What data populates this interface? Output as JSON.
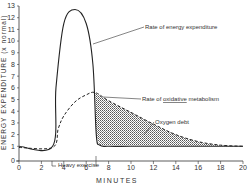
{
  "chart_data": {
    "type": "line",
    "title": "",
    "xlabel": "MINUTES",
    "ylabel": "ENERGY EXPENDITURE (x normal)",
    "xlim": [
      0,
      20
    ],
    "ylim": [
      0,
      13
    ],
    "x_ticks": [
      "0",
      "2",
      "4",
      "6",
      "8",
      "10",
      "12",
      "14",
      "16",
      "18",
      "20"
    ],
    "y_ticks": [
      "0",
      "1",
      "2",
      "3",
      "4",
      "5",
      "6",
      "7",
      "8",
      "9",
      "10",
      "11",
      "12",
      "13"
    ],
    "grid": false,
    "series": [
      {
        "name": "Rate of energy expenditure",
        "style": "solid",
        "x": [
          0,
          3,
          3.3,
          4,
          5,
          6,
          6.6,
          6.9,
          7.2,
          8,
          10,
          14,
          20
        ],
        "y": [
          1,
          1,
          6,
          11.5,
          12.7,
          11.5,
          8,
          2,
          1.1,
          1,
          1,
          1,
          1
        ]
      },
      {
        "name": "Rate of oxidative metabolism",
        "style": "dashed",
        "x": [
          0,
          3,
          3.5,
          4,
          5,
          6,
          6.8,
          8,
          10,
          12,
          14,
          16,
          18,
          20
        ],
        "y": [
          0.9,
          0.9,
          2.5,
          3.6,
          4.8,
          5.4,
          5.6,
          4.9,
          3.9,
          2.9,
          2.0,
          1.4,
          1.1,
          1.0
        ]
      }
    ],
    "annotations": [
      {
        "text": "Rate of energy expenditure",
        "points_to": "solid curve, descending limb"
      },
      {
        "text": "Rate of oxidative metabolism",
        "points_to": "dashed curve peak"
      },
      {
        "text": "Oxygen debt",
        "points_to": "hatched area between curves after exercise"
      },
      {
        "text": "Heavy exercise",
        "span": [
          3,
          7
        ]
      }
    ],
    "shaded_region": {
      "label": "Oxygen debt",
      "x_range": [
        6.8,
        20
      ],
      "pattern": "hatched"
    }
  },
  "labels": {
    "ylabel": "ENERGY  EXPENDITURE  (x normal)",
    "xlabel": "MINUTES",
    "energy": "Rate of energy expenditure",
    "oxidative_prefix": "Rate of",
    "oxidative_word": "oxidative",
    "oxidative_suffix": "metabolism",
    "oxygen_debt": "Oxygen debt",
    "heavy_exercise": "Heavy exercise"
  }
}
